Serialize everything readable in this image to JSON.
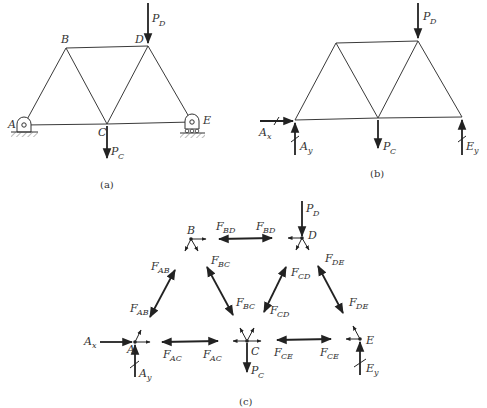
{
  "figure": {
    "panels": [
      {
        "id": "a",
        "caption": "(a)",
        "description": "Truss with pin support at A and roller support at E, loads P_D at D and P_C at C",
        "joints": {
          "A": {
            "label": "A"
          },
          "B": {
            "label": "B"
          },
          "C": {
            "label": "C"
          },
          "D": {
            "label": "D"
          },
          "E": {
            "label": "E"
          }
        },
        "members": [
          "AB",
          "BC",
          "BD",
          "CD",
          "DE",
          "AC",
          "CE"
        ],
        "loads": [
          {
            "name": "P_D",
            "main": "P",
            "sub": "D",
            "joint": "D",
            "direction": "down"
          },
          {
            "name": "P_C",
            "main": "P",
            "sub": "C",
            "joint": "C",
            "direction": "down"
          }
        ],
        "supports": [
          {
            "joint": "A",
            "type": "pin"
          },
          {
            "joint": "E",
            "type": "roller"
          }
        ]
      },
      {
        "id": "b",
        "caption": "(b)",
        "description": "Free-body diagram of entire truss",
        "forces": [
          {
            "name": "A_x",
            "main": "A",
            "sub": "x",
            "direction": "right"
          },
          {
            "name": "A_y",
            "main": "A",
            "sub": "y",
            "direction": "up"
          },
          {
            "name": "E_y",
            "main": "E",
            "sub": "y",
            "direction": "up"
          },
          {
            "name": "P_D",
            "main": "P",
            "sub": "D",
            "direction": "down"
          },
          {
            "name": "P_C",
            "main": "P",
            "sub": "C",
            "direction": "down"
          }
        ]
      },
      {
        "id": "c",
        "caption": "(c)",
        "description": "Free-body diagrams of joints and members",
        "joint_labels": {
          "A": "A",
          "B": "B",
          "C": "C",
          "D": "D",
          "E": "E"
        },
        "member_forces": [
          {
            "name": "F_BD",
            "main": "F",
            "sub": "BD"
          },
          {
            "name": "F_AB",
            "main": "F",
            "sub": "AB"
          },
          {
            "name": "F_BC",
            "main": "F",
            "sub": "BC"
          },
          {
            "name": "F_CD",
            "main": "F",
            "sub": "CD"
          },
          {
            "name": "F_DE",
            "main": "F",
            "sub": "DE"
          },
          {
            "name": "F_AC",
            "main": "F",
            "sub": "AC"
          },
          {
            "name": "F_CE",
            "main": "F",
            "sub": "CE"
          }
        ],
        "external_forces": [
          {
            "name": "A_x",
            "main": "A",
            "sub": "x"
          },
          {
            "name": "A_y",
            "main": "A",
            "sub": "y"
          },
          {
            "name": "E_y",
            "main": "E",
            "sub": "y"
          },
          {
            "name": "P_D",
            "main": "P",
            "sub": "D"
          },
          {
            "name": "P_C",
            "main": "P",
            "sub": "C"
          }
        ]
      }
    ]
  },
  "text": {
    "A": "A",
    "B": "B",
    "C": "C",
    "D": "D",
    "E": "E",
    "P": "P",
    "F": "F",
    "sub_D": "D",
    "sub_C": "C",
    "sub_x": "x",
    "sub_y": "y",
    "sub_AB": "AB",
    "sub_BC": "BC",
    "sub_BD": "BD",
    "sub_CD": "CD",
    "sub_DE": "DE",
    "sub_AC": "AC",
    "sub_CE": "CE",
    "cap_a": "(a)",
    "cap_b": "(b)",
    "cap_c": "(c)"
  }
}
